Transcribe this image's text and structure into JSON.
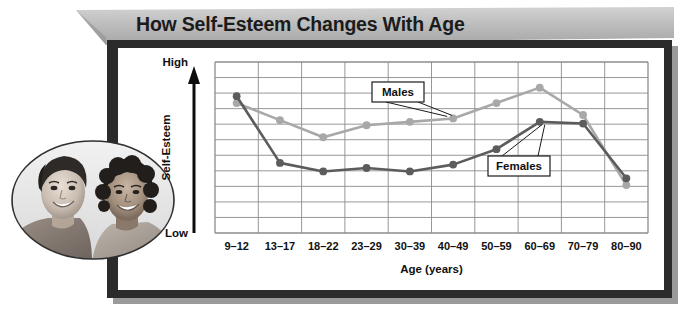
{
  "title": "How Self-Esteem Changes With Age",
  "photo": {
    "alt": "Two smiling young people back to back",
    "caption": ""
  },
  "chart_data": {
    "type": "line",
    "title": "How Self-Esteem Changes With Age",
    "xlabel": "Age (years)",
    "ylabel": "Self-Esteem",
    "categories": [
      "9–12",
      "13–17",
      "18–22",
      "23–29",
      "30–39",
      "40–49",
      "50–59",
      "60–69",
      "70–79",
      "80–90"
    ],
    "y_axis_ticks": [
      "High",
      "Low"
    ],
    "ylim": [
      0,
      10
    ],
    "y_axis_note": "Qualitative scale, Low at bottom to High at top",
    "grid": true,
    "grid_rows": 11,
    "grid_cols": 10,
    "legend_position": "inline-callouts",
    "series": [
      {
        "name": "Males",
        "color": "#a8a8a8",
        "values": [
          7.6,
          6.6,
          5.6,
          6.3,
          6.5,
          6.7,
          7.6,
          8.5,
          6.9,
          2.8
        ]
      },
      {
        "name": "Females",
        "color": "#5c5c5c",
        "values": [
          8.0,
          4.1,
          3.6,
          3.8,
          3.6,
          4.0,
          4.9,
          6.5,
          6.4,
          3.2
        ]
      }
    ],
    "annotations": [
      {
        "text": "Males",
        "target_series": "Males"
      },
      {
        "text": "Females",
        "target_series": "Females"
      }
    ]
  },
  "colors": {
    "frame": "#2b2b2b",
    "ribbon": "#b4b4b4",
    "panel": "#ffffff",
    "grid": "#8c8c8c",
    "males": "#a8a8a8",
    "females": "#5c5c5c"
  }
}
